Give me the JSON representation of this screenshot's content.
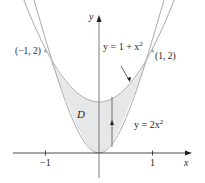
{
  "figure": {
    "axes": {
      "x_label": "x",
      "y_label": "y",
      "x_ticks": [
        {
          "value": -1,
          "label": "−1"
        },
        {
          "value": 1,
          "label": "1"
        }
      ]
    },
    "curves": [
      {
        "name": "upper",
        "equation_lhs": "y = 1 + x",
        "exponent": "2"
      },
      {
        "name": "lower",
        "equation_lhs": "y = 2x",
        "exponent": "2"
      }
    ],
    "points": [
      {
        "label": "(−1, 2)"
      },
      {
        "label": "(1, 2)"
      }
    ],
    "region_label": "D",
    "colors": {
      "curve": "#a7a9ac",
      "fill": "#e6e7e8",
      "axis": "#231f20",
      "segment": "#6d6e71",
      "text": "#231f20"
    }
  }
}
